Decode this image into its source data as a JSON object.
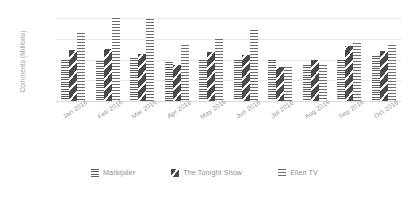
{
  "chart_data": {
    "type": "bar",
    "title": "",
    "xlabel": "",
    "ylabel": "Comments (Millions)",
    "ylim": [
      0,
      100
    ],
    "yticks": [
      0,
      100
    ],
    "ytick_labels": [
      "0",
      "100"
    ],
    "grid": true,
    "legend_position": "bottom",
    "categories": [
      "Jan 2016",
      "Feb 2016",
      "Mar 2016",
      "Apr 2016",
      "May 2016",
      "Jun 2016",
      "Jul 2016",
      "Aug 2016",
      "Sep 2016",
      "Oct 2016"
    ],
    "series": [
      {
        "name": "Markiplier",
        "pattern": "horizontal-lines",
        "values": [
          50,
          48,
          52,
          47,
          50,
          49,
          50,
          43,
          50,
          54
        ]
      },
      {
        "name": "The Tonight Show",
        "pattern": "diagonal-dark",
        "values": [
          61,
          63,
          57,
          43,
          59,
          55,
          41,
          50,
          66,
          60
        ]
      },
      {
        "name": "Ellen TV",
        "pattern": "dotted-checker",
        "values": [
          82,
          100,
          99,
          68,
          75,
          85,
          41,
          43,
          70,
          68
        ]
      }
    ]
  },
  "axis": {
    "y_title": "Comments (Millions)",
    "y_top_label": "100",
    "y_bottom_label": "0"
  },
  "legend": {
    "items": [
      {
        "label": "Markiplier",
        "icon": "hatch-horizontal-swatch"
      },
      {
        "label": "The Tonight Show",
        "icon": "hatch-diagonal-swatch"
      },
      {
        "label": "Ellen TV",
        "icon": "hatch-dotted-swatch"
      }
    ]
  }
}
